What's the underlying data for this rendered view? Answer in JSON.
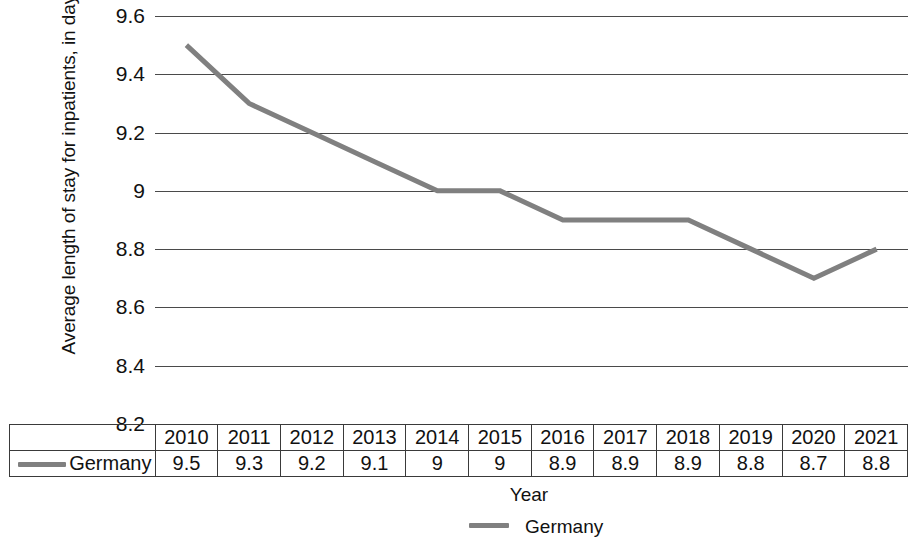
{
  "chart_data": {
    "type": "line",
    "title": "",
    "xlabel": "Year",
    "ylabel": "Average length of stay for inpatients, in days",
    "categories": [
      "2010",
      "2011",
      "2012",
      "2013",
      "2014",
      "2015",
      "2016",
      "2017",
      "2018",
      "2019",
      "2020",
      "2021"
    ],
    "series": [
      {
        "name": "Germany",
        "values": [
          9.5,
          9.3,
          9.2,
          9.1,
          9,
          9,
          8.9,
          8.9,
          8.9,
          8.8,
          8.7,
          8.8
        ],
        "labels": [
          "9.5",
          "9.3",
          "9.2",
          "9.1",
          "9",
          "9",
          "8.9",
          "8.9",
          "8.9",
          "8.8",
          "8.7",
          "8.8"
        ],
        "color": "#808080"
      }
    ],
    "ylim": [
      8.2,
      9.6
    ],
    "yticks": [
      9.6,
      9.4,
      9.2,
      9,
      8.8,
      8.6,
      8.4,
      8.2
    ],
    "ytick_labels": [
      "9.6",
      "9.4",
      "9.2",
      "9",
      "8.8",
      "8.6",
      "8.4",
      "8.2"
    ],
    "grid": true,
    "grid_color": "#4a4a4a",
    "legend_position": "bottom",
    "legend_entries": [
      "Germany"
    ],
    "data_table_visible": true,
    "data_table_row_label": "Germany"
  },
  "axes": {
    "y_title": "Average length of stay for inpatients, in days",
    "x_title": "Year"
  },
  "legend": {
    "entry_label": "Germany"
  },
  "table": {
    "row_label": "Germany",
    "years": [
      "2010",
      "2011",
      "2012",
      "2013",
      "2014",
      "2015",
      "2016",
      "2017",
      "2018",
      "2019",
      "2020",
      "2021"
    ],
    "values": [
      "9.5",
      "9.3",
      "9.2",
      "9.1",
      "9",
      "9",
      "8.9",
      "8.9",
      "8.9",
      "8.8",
      "8.7",
      "8.8"
    ]
  },
  "colors": {
    "series_line": "#808080",
    "gridline": "#4a4a4a",
    "text": "#111111",
    "background": "#ffffff"
  }
}
